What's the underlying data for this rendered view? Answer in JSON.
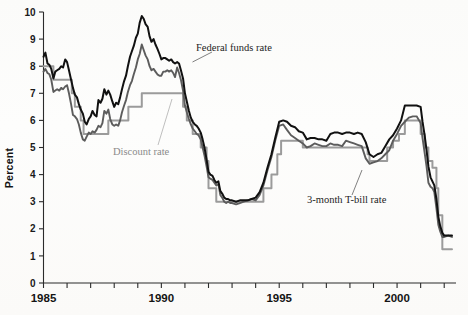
{
  "chart_data": {
    "type": "line",
    "title": "",
    "xlabel": "",
    "ylabel": "Percent",
    "xlim": [
      1985.0,
      2002.5
    ],
    "ylim": [
      0,
      10
    ],
    "yticks": [
      0,
      1,
      2,
      3,
      4,
      5,
      6,
      7,
      8,
      9,
      10
    ],
    "ytick_labels": [
      "0",
      "1",
      "2",
      "3",
      "4",
      "5",
      "6",
      "7",
      "8",
      "9",
      "10"
    ],
    "xticks": [
      1985,
      1986,
      1987,
      1988,
      1989,
      1990,
      1991,
      1992,
      1993,
      1994,
      1995,
      1996,
      1997,
      1998,
      1999,
      2000,
      2001,
      2002
    ],
    "xtick_labels_shown": [
      "1985",
      "1990",
      "1995",
      "2000"
    ],
    "grid": false,
    "legend_position": "inline-annotations",
    "series": [
      {
        "name": "Federal funds rate",
        "color": "#111111",
        "annotation": "Federal funds rate",
        "x": [
          1985.0,
          1985.08,
          1985.17,
          1985.25,
          1985.33,
          1985.42,
          1985.5,
          1985.58,
          1985.67,
          1985.75,
          1985.83,
          1985.92,
          1986.0,
          1986.08,
          1986.17,
          1986.25,
          1986.33,
          1986.42,
          1986.5,
          1986.58,
          1986.67,
          1986.75,
          1986.83,
          1986.92,
          1987.0,
          1987.08,
          1987.17,
          1987.25,
          1987.33,
          1987.42,
          1987.5,
          1987.58,
          1987.67,
          1987.75,
          1987.83,
          1987.92,
          1988.0,
          1988.08,
          1988.17,
          1988.25,
          1988.33,
          1988.42,
          1988.5,
          1988.58,
          1988.67,
          1988.75,
          1988.83,
          1988.92,
          1989.0,
          1989.08,
          1989.17,
          1989.25,
          1989.33,
          1989.42,
          1989.5,
          1989.58,
          1989.67,
          1989.75,
          1989.83,
          1989.92,
          1990.0,
          1990.08,
          1990.17,
          1990.25,
          1990.33,
          1990.42,
          1990.5,
          1990.58,
          1990.67,
          1990.75,
          1990.83,
          1990.92,
          1991.0,
          1991.08,
          1991.17,
          1991.25,
          1991.33,
          1991.42,
          1991.5,
          1991.58,
          1991.67,
          1991.75,
          1991.83,
          1991.92,
          1992.0,
          1992.08,
          1992.17,
          1992.25,
          1992.33,
          1992.42,
          1992.5,
          1992.58,
          1992.67,
          1992.75,
          1992.83,
          1992.92,
          1993.0,
          1993.17,
          1993.33,
          1993.5,
          1993.67,
          1993.83,
          1994.0,
          1994.17,
          1994.33,
          1994.5,
          1994.67,
          1994.83,
          1995.0,
          1995.17,
          1995.33,
          1995.5,
          1995.67,
          1995.83,
          1996.0,
          1996.17,
          1996.33,
          1996.5,
          1996.67,
          1996.83,
          1997.0,
          1997.17,
          1997.33,
          1997.5,
          1997.67,
          1997.83,
          1998.0,
          1998.17,
          1998.33,
          1998.5,
          1998.67,
          1998.83,
          1999.0,
          1999.17,
          1999.33,
          1999.5,
          1999.67,
          1999.83,
          2000.0,
          2000.17,
          2000.33,
          2000.5,
          2000.67,
          2000.83,
          2001.0,
          2001.08,
          2001.17,
          2001.25,
          2001.33,
          2001.42,
          2001.5,
          2001.58,
          2001.67,
          2001.75,
          2001.83,
          2001.92,
          2002.0,
          2002.17,
          2002.33
        ],
        "y": [
          8.35,
          8.5,
          8.1,
          8.05,
          7.9,
          7.55,
          7.8,
          7.85,
          7.9,
          8.0,
          7.95,
          8.25,
          8.15,
          7.85,
          7.5,
          7.2,
          6.95,
          6.85,
          6.6,
          6.4,
          6.25,
          5.95,
          5.85,
          6.05,
          6.15,
          6.35,
          6.2,
          6.15,
          6.75,
          6.65,
          6.8,
          7.15,
          6.95,
          7.1,
          6.95,
          6.7,
          6.5,
          6.65,
          6.6,
          6.85,
          7.15,
          7.45,
          7.65,
          8.0,
          8.35,
          8.55,
          8.75,
          9.05,
          9.2,
          9.6,
          9.85,
          9.75,
          9.55,
          9.45,
          9.1,
          8.9,
          9.0,
          8.8,
          8.65,
          8.45,
          8.25,
          8.3,
          8.3,
          8.25,
          8.2,
          8.25,
          8.15,
          8.1,
          8.15,
          8.1,
          7.85,
          7.55,
          7.0,
          6.7,
          6.35,
          6.1,
          5.95,
          5.85,
          5.8,
          5.7,
          5.55,
          5.3,
          5.0,
          4.55,
          4.1,
          4.0,
          3.95,
          3.8,
          3.7,
          3.75,
          3.4,
          3.3,
          3.15,
          3.1,
          3.1,
          3.05,
          3.05,
          3.0,
          3.05,
          3.05,
          3.05,
          3.1,
          3.15,
          3.35,
          3.7,
          4.25,
          4.75,
          5.35,
          5.95,
          6.0,
          5.95,
          5.8,
          5.75,
          5.6,
          5.55,
          5.3,
          5.35,
          5.35,
          5.3,
          5.3,
          5.25,
          5.5,
          5.55,
          5.55,
          5.5,
          5.55,
          5.55,
          5.5,
          5.55,
          5.5,
          5.2,
          4.75,
          4.65,
          4.75,
          4.8,
          5.05,
          5.3,
          5.45,
          5.7,
          6.0,
          6.55,
          6.55,
          6.55,
          6.55,
          6.5,
          5.95,
          5.45,
          4.9,
          4.3,
          3.9,
          3.75,
          3.6,
          3.1,
          2.45,
          2.1,
          1.85,
          1.75,
          1.75,
          1.75
        ]
      },
      {
        "name": "3-month T-bill rate",
        "color": "#5c5c5c",
        "annotation": "3-month T-bill rate",
        "x": [
          1985.0,
          1985.08,
          1985.17,
          1985.25,
          1985.33,
          1985.42,
          1985.5,
          1985.58,
          1985.67,
          1985.75,
          1985.83,
          1985.92,
          1986.0,
          1986.08,
          1986.17,
          1986.25,
          1986.33,
          1986.42,
          1986.5,
          1986.58,
          1986.67,
          1986.75,
          1986.83,
          1986.92,
          1987.0,
          1987.08,
          1987.17,
          1987.25,
          1987.33,
          1987.42,
          1987.5,
          1987.58,
          1987.67,
          1987.75,
          1987.83,
          1987.92,
          1988.0,
          1988.08,
          1988.17,
          1988.25,
          1988.33,
          1988.42,
          1988.5,
          1988.58,
          1988.67,
          1988.75,
          1988.83,
          1988.92,
          1989.0,
          1989.08,
          1989.17,
          1989.25,
          1989.33,
          1989.42,
          1989.5,
          1989.58,
          1989.67,
          1989.75,
          1989.83,
          1989.92,
          1990.0,
          1990.08,
          1990.17,
          1990.25,
          1990.33,
          1990.42,
          1990.5,
          1990.58,
          1990.67,
          1990.75,
          1990.83,
          1990.92,
          1991.0,
          1991.08,
          1991.17,
          1991.25,
          1991.33,
          1991.42,
          1991.5,
          1991.58,
          1991.67,
          1991.75,
          1991.83,
          1991.92,
          1992.0,
          1992.08,
          1992.17,
          1992.25,
          1992.33,
          1992.42,
          1992.5,
          1992.58,
          1992.67,
          1992.75,
          1992.83,
          1992.92,
          1993.0,
          1993.17,
          1993.33,
          1993.5,
          1993.67,
          1993.83,
          1994.0,
          1994.17,
          1994.33,
          1994.5,
          1994.67,
          1994.83,
          1995.0,
          1995.17,
          1995.33,
          1995.5,
          1995.67,
          1995.83,
          1996.0,
          1996.17,
          1996.33,
          1996.5,
          1996.67,
          1996.83,
          1997.0,
          1997.17,
          1997.33,
          1997.5,
          1997.67,
          1997.83,
          1998.0,
          1998.17,
          1998.33,
          1998.5,
          1998.67,
          1998.83,
          1999.0,
          1999.17,
          1999.33,
          1999.5,
          1999.67,
          1999.83,
          2000.0,
          2000.17,
          2000.33,
          2000.5,
          2000.67,
          2000.83,
          2001.0,
          2001.08,
          2001.17,
          2001.25,
          2001.33,
          2001.42,
          2001.5,
          2001.58,
          2001.67,
          2001.75,
          2001.83,
          2001.92,
          2002.0,
          2002.17,
          2002.33
        ],
        "y": [
          7.8,
          7.9,
          7.75,
          7.7,
          7.5,
          7.05,
          7.1,
          7.15,
          7.1,
          7.2,
          7.15,
          7.25,
          7.3,
          7.0,
          6.6,
          6.2,
          6.15,
          6.05,
          5.85,
          5.55,
          5.3,
          5.25,
          5.4,
          5.55,
          5.5,
          5.6,
          5.55,
          5.65,
          5.8,
          5.75,
          5.9,
          6.35,
          6.25,
          6.4,
          6.05,
          5.85,
          5.8,
          5.85,
          5.8,
          6.0,
          6.3,
          6.55,
          6.75,
          7.05,
          7.3,
          7.45,
          7.7,
          7.95,
          8.25,
          8.45,
          8.8,
          8.6,
          8.4,
          8.25,
          8.0,
          7.85,
          7.9,
          7.8,
          7.7,
          7.65,
          7.65,
          7.8,
          7.8,
          7.85,
          7.8,
          7.85,
          7.75,
          7.6,
          7.95,
          7.75,
          7.5,
          7.1,
          6.55,
          6.3,
          6.05,
          5.85,
          5.7,
          5.6,
          5.5,
          5.45,
          5.3,
          5.0,
          4.7,
          4.3,
          3.9,
          3.85,
          3.8,
          3.7,
          3.6,
          3.65,
          3.25,
          3.15,
          3.0,
          2.95,
          3.0,
          2.95,
          2.95,
          2.9,
          2.95,
          3.0,
          3.05,
          3.1,
          3.05,
          3.25,
          3.6,
          4.15,
          4.65,
          5.25,
          5.8,
          5.85,
          5.65,
          5.45,
          5.35,
          5.25,
          5.15,
          5.0,
          5.05,
          5.15,
          5.1,
          5.05,
          5.05,
          5.15,
          5.1,
          5.1,
          5.05,
          5.25,
          5.2,
          5.15,
          5.1,
          5.05,
          4.6,
          4.4,
          4.45,
          4.5,
          4.6,
          4.75,
          4.9,
          5.25,
          5.5,
          5.8,
          5.95,
          6.1,
          6.15,
          6.15,
          5.9,
          5.35,
          4.8,
          4.3,
          3.7,
          3.55,
          3.5,
          3.35,
          2.75,
          2.15,
          1.9,
          1.7,
          1.7,
          1.75,
          1.7
        ]
      },
      {
        "name": "Discount rate",
        "color": "#9b9b9b",
        "annotation": "Discount rate",
        "x": [
          1985.0,
          1985.42,
          1985.42,
          1986.2,
          1986.2,
          1986.33,
          1986.33,
          1986.58,
          1986.58,
          1986.7,
          1986.7,
          1987.75,
          1987.75,
          1988.6,
          1988.6,
          1989.17,
          1989.17,
          1990.92,
          1990.92,
          1991.08,
          1991.08,
          1991.33,
          1991.33,
          1991.67,
          1991.67,
          1991.92,
          1991.92,
          1992.0,
          1992.0,
          1992.33,
          1992.33,
          1992.67,
          1992.67,
          1994.33,
          1994.33,
          1994.67,
          1994.67,
          1994.92,
          1994.92,
          1995.08,
          1995.08,
          1996.0,
          1996.0,
          1998.75,
          1998.75,
          1998.83,
          1998.83,
          1998.92,
          1998.92,
          1999.58,
          1999.58,
          1999.83,
          1999.83,
          2000.08,
          2000.08,
          2000.33,
          2000.33,
          2001.0,
          2001.0,
          2001.17,
          2001.17,
          2001.33,
          2001.33,
          2001.5,
          2001.5,
          2001.67,
          2001.67,
          2001.75,
          2001.75,
          2001.92,
          2001.92,
          2002.33
        ],
        "y": [
          8.0,
          8.0,
          7.5,
          7.5,
          7.0,
          7.0,
          6.5,
          6.5,
          6.0,
          6.0,
          5.5,
          5.5,
          6.0,
          6.0,
          6.5,
          6.5,
          7.0,
          7.0,
          6.5,
          6.5,
          6.0,
          6.0,
          5.5,
          5.5,
          5.0,
          5.0,
          4.5,
          4.5,
          3.5,
          3.5,
          3.0,
          3.0,
          3.0,
          3.0,
          3.5,
          3.5,
          4.0,
          4.0,
          4.75,
          4.75,
          5.25,
          5.25,
          5.0,
          5.0,
          4.75,
          4.75,
          4.5,
          4.5,
          4.5,
          4.5,
          5.0,
          5.0,
          5.25,
          5.25,
          5.5,
          5.5,
          6.0,
          6.0,
          5.5,
          5.5,
          5.0,
          5.0,
          4.5,
          4.5,
          4.25,
          4.25,
          3.5,
          3.5,
          2.5,
          2.5,
          1.25,
          1.25
        ]
      }
    ]
  },
  "annotations": {
    "federal_funds": "Federal funds rate",
    "discount": "Discount rate",
    "tbill": "3-month T-bill rate"
  },
  "axes": {
    "ylabel": "Percent",
    "ytick_labels": [
      "0",
      "1",
      "2",
      "3",
      "4",
      "5",
      "6",
      "7",
      "8",
      "9",
      "10"
    ],
    "xtick_labels": [
      "1985",
      "1990",
      "1995",
      "2000"
    ]
  },
  "ghost_text": "                                                                                                                                                                                                                                                                                                                 "
}
